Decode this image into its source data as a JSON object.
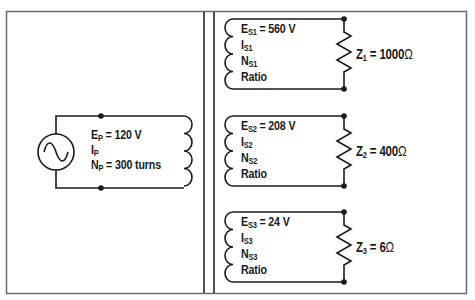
{
  "diagram": {
    "type": "transformer-circuit",
    "stroke_color": "#1a1a1a",
    "frame_color": "#6b6b6b",
    "source": {
      "icon": "ac-sine-source"
    },
    "primary": {
      "voltage": {
        "sym": "E",
        "sub": "P",
        "val": " = 120 V"
      },
      "current": {
        "sym": "I",
        "sub": "P"
      },
      "turns": {
        "sym": "N",
        "sub": "P",
        "val": " = 300 turns"
      }
    },
    "secondaries": [
      {
        "voltage": {
          "sym": "E",
          "sub": "S1",
          "val": " = 560 V"
        },
        "current": {
          "sym": "I",
          "sub": "S1"
        },
        "turns": {
          "sym": "N",
          "sub": "S1"
        },
        "ratio": "Ratio",
        "load": {
          "sym": "Z",
          "sub": "1",
          "val": " = 1000",
          "unit": "Ω"
        }
      },
      {
        "voltage": {
          "sym": "E",
          "sub": "S2",
          "val": " = 208 V"
        },
        "current": {
          "sym": "I",
          "sub": "S2"
        },
        "turns": {
          "sym": "N",
          "sub": "S2"
        },
        "ratio": "Ratio",
        "load": {
          "sym": "Z",
          "sub": "2",
          "val": " = 400",
          "unit": "Ω"
        }
      },
      {
        "voltage": {
          "sym": "E",
          "sub": "S3",
          "val": " = 24 V"
        },
        "current": {
          "sym": "I",
          "sub": "S3"
        },
        "turns": {
          "sym": "N",
          "sub": "S3"
        },
        "ratio": "Ratio",
        "load": {
          "sym": "Z",
          "sub": "3",
          "val": " = 6",
          "unit": "Ω"
        }
      }
    ]
  }
}
